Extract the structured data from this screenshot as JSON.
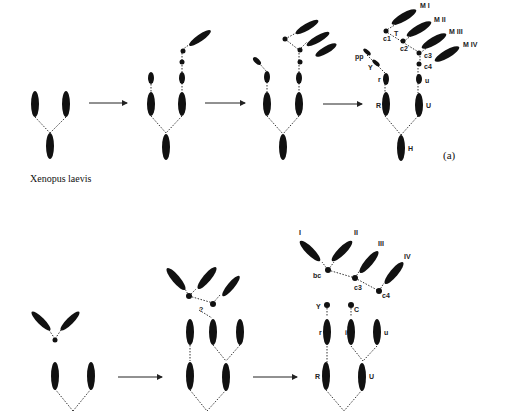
{
  "figure": {
    "species_label": "Xenopus laevis",
    "panel_a_label": "(a)"
  },
  "panel_a": {
    "labels": {
      "pp": "pp",
      "Y": "Y",
      "r": "r",
      "R": "R",
      "H": "H",
      "U": "U",
      "u": "u",
      "c1": "c1",
      "T": "T",
      "c2": "c2",
      "c3": "c3",
      "c4": "c4",
      "MI": "M I",
      "MII": "M II",
      "MIII": "M III",
      "MIV": "M IV"
    }
  },
  "panel_b": {
    "labels": {
      "q": "?",
      "I": "I",
      "II": "II",
      "III": "III",
      "IV": "IV",
      "bc": "bc",
      "c3": "c3",
      "c4": "c4",
      "Y": "Y",
      "C": "C",
      "r": "r",
      "i": "i",
      "u": "u",
      "R": "R",
      "U": "U"
    }
  },
  "colors": {
    "element": "#111111",
    "background": "#ffffff"
  }
}
